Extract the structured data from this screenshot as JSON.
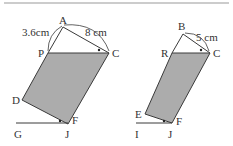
{
  "figures": [
    {
      "name": "left-figure",
      "triangle_apex": "A",
      "labels": {
        "A": "A",
        "P": "P",
        "C": "C",
        "D": "D",
        "F": "F",
        "G": "G",
        "J": "J"
      },
      "measurements": {
        "AP": "3.6cm",
        "AC": "8 cm"
      }
    },
    {
      "name": "right-figure",
      "triangle_apex": "B",
      "labels": {
        "B": "B",
        "R": "R",
        "C": "C",
        "E": "E",
        "F": "F",
        "I": "I",
        "J": "J"
      },
      "measurements": {
        "BC": "5 cm"
      }
    }
  ],
  "colors": {
    "fill": "#acacac",
    "stroke": "#3a3a3a",
    "rule": "#888888"
  }
}
